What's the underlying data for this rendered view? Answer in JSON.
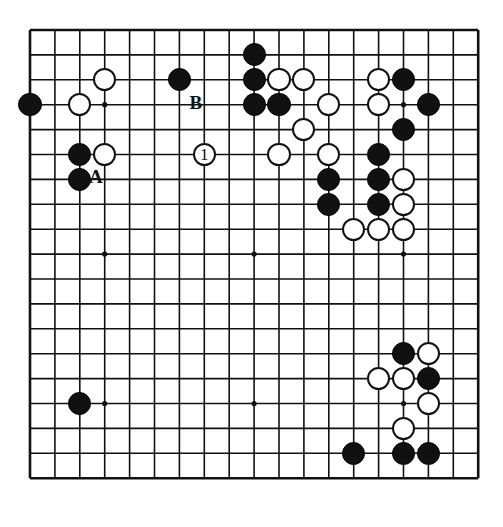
{
  "diagram": {
    "type": "go-board-diagram",
    "board_size": 19,
    "visible_grid": {
      "cols": 19,
      "rows": 19
    },
    "colors": {
      "black_stone": "#111111",
      "white_stone": "#ffffff",
      "stone_outline": "#111111",
      "grid_line": "#111111",
      "board_background": "#ffffff"
    },
    "geometry": {
      "origin_x": 8,
      "origin_y": 8,
      "spacing": 24.9,
      "stone_radius": 11.6,
      "border_width": 2.6,
      "line_width": 1.6
    },
    "star_points": [
      {
        "col": 3,
        "row": 3
      },
      {
        "col": 9,
        "row": 3
      },
      {
        "col": 15,
        "row": 3
      },
      {
        "col": 3,
        "row": 9
      },
      {
        "col": 9,
        "row": 9
      },
      {
        "col": 15,
        "row": 9
      },
      {
        "col": 3,
        "row": 15
      },
      {
        "col": 9,
        "row": 15
      },
      {
        "col": 15,
        "row": 15
      }
    ],
    "stones": [
      {
        "col": 3,
        "row": 2,
        "color": "white",
        "label": ""
      },
      {
        "col": 6,
        "row": 2,
        "color": "black",
        "label": ""
      },
      {
        "col": 9,
        "row": 1,
        "color": "black",
        "label": ""
      },
      {
        "col": 9,
        "row": 2,
        "color": "black",
        "label": ""
      },
      {
        "col": 10,
        "row": 2,
        "color": "white",
        "label": ""
      },
      {
        "col": 11,
        "row": 2,
        "color": "white",
        "label": ""
      },
      {
        "col": 14,
        "row": 2,
        "color": "white",
        "label": ""
      },
      {
        "col": 15,
        "row": 2,
        "color": "black",
        "label": ""
      },
      {
        "col": 0,
        "row": 3,
        "color": "black",
        "label": ""
      },
      {
        "col": 2,
        "row": 3,
        "color": "white",
        "label": ""
      },
      {
        "col": 9,
        "row": 3,
        "color": "black",
        "label": ""
      },
      {
        "col": 10,
        "row": 3,
        "color": "black",
        "label": ""
      },
      {
        "col": 12,
        "row": 3,
        "color": "white",
        "label": ""
      },
      {
        "col": 14,
        "row": 3,
        "color": "white",
        "label": ""
      },
      {
        "col": 16,
        "row": 3,
        "color": "black",
        "label": ""
      },
      {
        "col": 11,
        "row": 4,
        "color": "white",
        "label": ""
      },
      {
        "col": 15,
        "row": 4,
        "color": "black",
        "label": ""
      },
      {
        "col": 7,
        "row": 5,
        "color": "white",
        "label": "1"
      },
      {
        "col": 2,
        "row": 5,
        "color": "black",
        "label": ""
      },
      {
        "col": 3,
        "row": 5,
        "color": "white",
        "label": ""
      },
      {
        "col": 10,
        "row": 5,
        "color": "white",
        "label": ""
      },
      {
        "col": 12,
        "row": 5,
        "color": "white",
        "label": ""
      },
      {
        "col": 14,
        "row": 5,
        "color": "black",
        "label": ""
      },
      {
        "col": 2,
        "row": 6,
        "color": "black",
        "label": ""
      },
      {
        "col": 12,
        "row": 6,
        "color": "black",
        "label": ""
      },
      {
        "col": 14,
        "row": 6,
        "color": "black",
        "label": ""
      },
      {
        "col": 15,
        "row": 6,
        "color": "white",
        "label": ""
      },
      {
        "col": 12,
        "row": 7,
        "color": "black",
        "label": ""
      },
      {
        "col": 14,
        "row": 7,
        "color": "black",
        "label": ""
      },
      {
        "col": 15,
        "row": 7,
        "color": "white",
        "label": ""
      },
      {
        "col": 13,
        "row": 8,
        "color": "white",
        "label": ""
      },
      {
        "col": 14,
        "row": 8,
        "color": "white",
        "label": ""
      },
      {
        "col": 15,
        "row": 8,
        "color": "white",
        "label": ""
      },
      {
        "col": 15,
        "row": 13,
        "color": "black",
        "label": ""
      },
      {
        "col": 16,
        "row": 13,
        "color": "white",
        "label": ""
      },
      {
        "col": 14,
        "row": 14,
        "color": "white",
        "label": ""
      },
      {
        "col": 15,
        "row": 14,
        "color": "white",
        "label": ""
      },
      {
        "col": 16,
        "row": 14,
        "color": "black",
        "label": ""
      },
      {
        "col": 16,
        "row": 15,
        "color": "white",
        "label": ""
      },
      {
        "col": 2,
        "row": 15,
        "color": "black",
        "label": ""
      },
      {
        "col": 15,
        "row": 16,
        "color": "white",
        "label": ""
      },
      {
        "col": 13,
        "row": 17,
        "color": "black",
        "label": ""
      },
      {
        "col": 15,
        "row": 17,
        "color": "black",
        "label": ""
      },
      {
        "col": 16,
        "row": 17,
        "color": "black",
        "label": ""
      }
    ],
    "annotations": [
      {
        "text": "A",
        "name": "point-label-a",
        "col": 3,
        "row": 6,
        "offset_x": -2,
        "offset_y": -1
      },
      {
        "text": "B",
        "name": "point-label-b",
        "col": 7,
        "row": 3,
        "offset_x": -2,
        "offset_y": -1
      }
    ],
    "move_markers": [
      {
        "text": "1",
        "col": 7,
        "row": 5,
        "color": "white"
      }
    ]
  }
}
